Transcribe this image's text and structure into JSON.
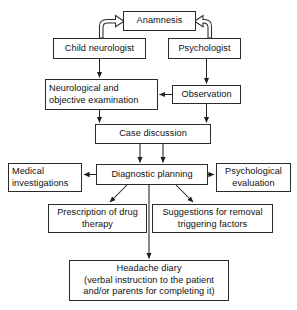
{
  "diagram": {
    "type": "flowchart",
    "background_color": "#ffffff",
    "line_color": "#1e1e1e",
    "box_border_color": "#2b2b2b",
    "text_color": "#111111",
    "nodes": [
      {
        "id": "anamnesis",
        "label": "Anamnesis",
        "x": 123,
        "y": 11,
        "w": 73,
        "h": 20,
        "align": "center"
      },
      {
        "id": "child_neurologist",
        "label": "Child neurologist",
        "x": 53,
        "y": 38,
        "w": 93,
        "h": 21,
        "align": "center"
      },
      {
        "id": "psychologist",
        "label": "Psychologist",
        "x": 168,
        "y": 38,
        "w": 73,
        "h": 21,
        "align": "center"
      },
      {
        "id": "neuro_exam",
        "label": "Neurological and\nobjective examination",
        "x": 45,
        "y": 79,
        "w": 113,
        "h": 31,
        "align": "left"
      },
      {
        "id": "observation",
        "label": "Observation",
        "x": 172,
        "y": 85,
        "w": 69,
        "h": 19,
        "align": "center"
      },
      {
        "id": "case_discussion",
        "label": "Case discussion",
        "x": 95,
        "y": 124,
        "w": 116,
        "h": 20,
        "align": "center"
      },
      {
        "id": "medical_invest",
        "label": "Medical\ninvestigations",
        "x": 8,
        "y": 163,
        "w": 74,
        "h": 29,
        "align": "left"
      },
      {
        "id": "diagnostic_plan",
        "label": "Diagnostic planning",
        "x": 96,
        "y": 164,
        "w": 112,
        "h": 21,
        "align": "center"
      },
      {
        "id": "psych_eval",
        "label": "Psychological\nevaluation",
        "x": 216,
        "y": 163,
        "w": 75,
        "h": 29,
        "align": "center"
      },
      {
        "id": "prescription",
        "label": "Prescription of drug\ntherapy",
        "x": 48,
        "y": 204,
        "w": 99,
        "h": 29,
        "align": "center"
      },
      {
        "id": "suggestions",
        "label": "Suggestions for removal\ntriggering factors",
        "x": 152,
        "y": 204,
        "w": 121,
        "h": 29,
        "align": "center"
      },
      {
        "id": "headache_diary",
        "label": "Headache diary\n(verbal instruction to the patient\nand/or parents for completing it)",
        "x": 69,
        "y": 260,
        "w": 160,
        "h": 41,
        "align": "center"
      }
    ],
    "edges": [
      {
        "from": "child_neurologist",
        "to": "anamnesis",
        "style": "curved-block-arrow"
      },
      {
        "from": "psychologist",
        "to": "anamnesis",
        "style": "curved-block-arrow"
      },
      {
        "from": "child_neurologist",
        "to": "neuro_exam",
        "style": "arrow"
      },
      {
        "from": "psychologist",
        "to": "observation",
        "style": "arrow"
      },
      {
        "from": "observation",
        "to": "neuro_exam",
        "style": "arrow"
      },
      {
        "from": "neuro_exam",
        "to": "case_discussion",
        "style": "arrow"
      },
      {
        "from": "observation",
        "to": "case_discussion",
        "style": "arrow"
      },
      {
        "from": "case_discussion",
        "to": "diagnostic_plan",
        "style": "arrow-double"
      },
      {
        "from": "diagnostic_plan",
        "to": "medical_invest",
        "style": "arrow"
      },
      {
        "from": "diagnostic_plan",
        "to": "psych_eval",
        "style": "arrow"
      },
      {
        "from": "diagnostic_plan",
        "to": "prescription",
        "style": "arrow"
      },
      {
        "from": "diagnostic_plan",
        "to": "suggestions",
        "style": "arrow"
      },
      {
        "from": "diagnostic_plan",
        "to": "headache_diary",
        "style": "arrow"
      }
    ]
  },
  "labels": {
    "anamnesis": "Anamnesis",
    "child_neurologist": "Child neurologist",
    "psychologist": "Psychologist",
    "neuro_exam_line1": "Neurological and",
    "neuro_exam_line2": "objective examination",
    "observation": "Observation",
    "case_discussion": "Case discussion",
    "medical_invest_line1": "Medical",
    "medical_invest_line2": "investigations",
    "diagnostic_plan": "Diagnostic planning",
    "psych_eval_line1": "Psychological",
    "psych_eval_line2": "evaluation",
    "prescription_line1": "Prescription of drug",
    "prescription_line2": "therapy",
    "suggestions_line1": "Suggestions for removal",
    "suggestions_line2": "triggering factors",
    "headache_diary_line1": "Headache diary",
    "headache_diary_line2": "(verbal instruction to the patient",
    "headache_diary_line3": "and/or parents for completing it)"
  }
}
